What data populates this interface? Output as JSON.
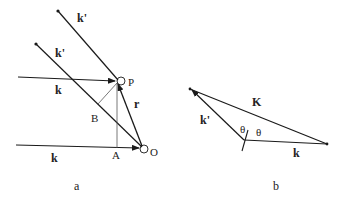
{
  "figure": {
    "panel_a": {
      "caption": "a",
      "labels": {
        "k_prime_upper": "k'",
        "k_prime_lower": "k'",
        "k_upper": "k",
        "k_lower": "k",
        "point_P": "P",
        "point_B": "B",
        "point_A": "A",
        "point_O": "O",
        "vector_r": "r"
      }
    },
    "panel_b": {
      "caption": "b",
      "labels": {
        "vector_K": "K",
        "vector_k_prime": "k'",
        "vector_k": "k",
        "angle_1": "θ",
        "angle_2": "θ"
      }
    },
    "colors": {
      "line": "#1a1a1a",
      "thin_line": "#555555"
    }
  }
}
